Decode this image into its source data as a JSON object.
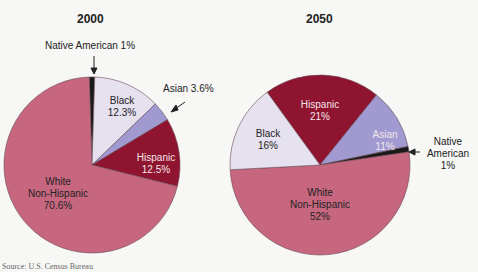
{
  "chart_data": [
    {
      "type": "pie",
      "title": "2000",
      "categories": [
        "Native American",
        "Black",
        "Asian",
        "Hispanic",
        "White Non-Hispanic"
      ],
      "values": [
        1,
        12.3,
        3.6,
        12.5,
        70.6
      ],
      "labels": [
        "Native American 1%",
        "Black 12.3%",
        "Asian 3.6%",
        "Hispanic 12.5%",
        "White Non-Hispanic 70.6%"
      ],
      "colors": [
        "#1a1a1a",
        "#e6e1ef",
        "#a09ad0",
        "#8e1430",
        "#c7667f"
      ]
    },
    {
      "type": "pie",
      "title": "2050",
      "categories": [
        "Hispanic",
        "Asian",
        "Native American",
        "White Non-Hispanic",
        "Black"
      ],
      "values": [
        21,
        11,
        1,
        52,
        16
      ],
      "labels": [
        "Hispanic 21%",
        "Asian 11%",
        "Native American 1%",
        "White Non-Hispanic 52%",
        "Black 16%"
      ],
      "colors": [
        "#8e1430",
        "#a09ad0",
        "#1a1a1a",
        "#c7667f",
        "#e6e1ef"
      ]
    }
  ],
  "text": {
    "title_2000": "2000",
    "title_2050": "2050",
    "p1": {
      "native_ext": "Native American 1%",
      "black_name": "Black",
      "black_pct": "12.3%",
      "asian_ext": "Asian 3.6%",
      "hisp_name": "Hispanic",
      "hisp_pct": "12.5%",
      "white_l1": "White",
      "white_l2": "Non-Hispanic",
      "white_pct": "70.6%"
    },
    "p2": {
      "hisp_name": "Hispanic",
      "hisp_pct": "21%",
      "black_name": "Black",
      "black_pct": "16%",
      "asian_name": "Asian",
      "asian_pct": "11%",
      "native_l1": "Native",
      "native_l2": "American",
      "native_pct": "1%",
      "white_l1": "White",
      "white_l2": "Non-Hispanic",
      "white_pct": "52%"
    },
    "source": "Source: U.S. Census Bureau"
  }
}
